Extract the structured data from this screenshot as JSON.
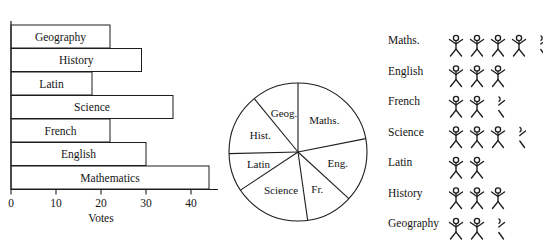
{
  "chart_data": [
    {
      "type": "bar",
      "orientation": "horizontal",
      "title": "",
      "xlabel": "Votes",
      "ylabel": "",
      "xlim": [
        0,
        45
      ],
      "xticks": [
        0,
        10,
        20,
        30,
        40
      ],
      "xtick_labels": [
        "0",
        "10",
        "20",
        "30",
        "40"
      ],
      "grid": false,
      "categories": [
        "Geography",
        "History",
        "Latin",
        "Science",
        "French",
        "English",
        "Mathematics"
      ],
      "values": [
        22,
        29,
        18,
        36,
        22,
        30,
        44
      ],
      "bar_labels_inside": true
    },
    {
      "type": "pie",
      "title": "",
      "legend_position": "inside-slices",
      "labels": [
        "Maths.",
        "Eng.",
        "Fr.",
        "Science",
        "Latin",
        "Hist.",
        "Geog."
      ],
      "values": [
        44,
        30,
        22,
        36,
        18,
        29,
        22
      ],
      "start_angle_deg": 0,
      "direction": "clockwise"
    },
    {
      "type": "pictogram",
      "title": "",
      "unit_note": "",
      "categories": [
        "Maths.",
        "English",
        "French",
        "Science",
        "Latin",
        "History",
        "Geography"
      ],
      "values": [
        4.5,
        3,
        2.5,
        3.5,
        2,
        3,
        2.5
      ],
      "symbol": "stick-figure"
    }
  ],
  "bar_chart": {
    "axis_title": "Votes",
    "tick_labels": [
      "0",
      "10",
      "20",
      "30",
      "40"
    ],
    "bars": [
      {
        "label": "Geography",
        "value": 22
      },
      {
        "label": "History",
        "value": 29
      },
      {
        "label": "Latin",
        "value": 18
      },
      {
        "label": "Science",
        "value": 36
      },
      {
        "label": "French",
        "value": 22
      },
      {
        "label": "English",
        "value": 30
      },
      {
        "label": "Mathematics",
        "value": 44
      }
    ]
  },
  "pie_chart": {
    "slices": [
      {
        "label": "Maths.",
        "value": 44
      },
      {
        "label": "Eng.",
        "value": 30
      },
      {
        "label": "Fr.",
        "value": 22
      },
      {
        "label": "Science",
        "value": 36
      },
      {
        "label": "Latin",
        "value": 18
      },
      {
        "label": "Hist.",
        "value": 29
      },
      {
        "label": "Geog.",
        "value": 22
      }
    ]
  },
  "pictogram": {
    "rows": [
      {
        "label": "Maths.",
        "value": 4.5
      },
      {
        "label": "English",
        "value": 3
      },
      {
        "label": "French",
        "value": 2.5
      },
      {
        "label": "Science",
        "value": 3.5
      },
      {
        "label": "Latin",
        "value": 2
      },
      {
        "label": "History",
        "value": 3
      },
      {
        "label": "Geography",
        "value": 2.5
      }
    ]
  },
  "colors": {
    "ink": "#1d1d1d",
    "paper": "#ffffff"
  }
}
